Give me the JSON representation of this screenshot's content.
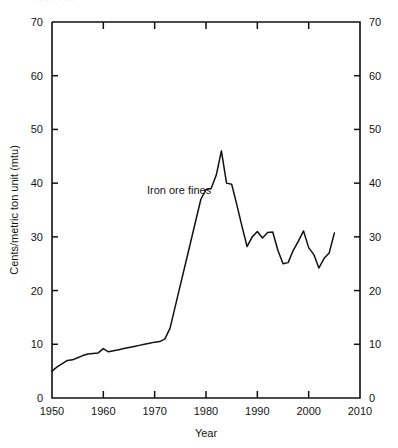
{
  "figure": {
    "top_clipped_text": "·  ·   ·    ·     ·      ·       ·",
    "background": "#ffffff",
    "line_color": "#111111"
  },
  "chart_data": {
    "type": "line",
    "title": "",
    "subtitle": "",
    "xlabel": "Year",
    "ylabel": "Cents/metric ton unit (mtu)",
    "xlim": [
      1950,
      2010
    ],
    "ylim": [
      0,
      70
    ],
    "xticks": [
      1950,
      1960,
      1970,
      1980,
      1990,
      2000,
      2010
    ],
    "xtick_labels": [
      "1950",
      "1960",
      "1970",
      "1980",
      "1990",
      "2000",
      "2010"
    ],
    "yticks": [
      0,
      10,
      20,
      30,
      40,
      50,
      60,
      70
    ],
    "ytick_labels": [
      "0",
      "10",
      "20",
      "30",
      "40",
      "50",
      "60",
      "70"
    ],
    "y_axis_right": true,
    "y_axis_right_labels": [
      "0",
      "10",
      "20",
      "30",
      "40",
      "50",
      "60",
      "70"
    ],
    "grid": false,
    "legend": "none",
    "annotations": [
      {
        "text": "Iron ore fines",
        "x": 1968.5,
        "y": 38.0
      }
    ],
    "series": [
      {
        "name": "Iron ore fines",
        "color": "#111111",
        "x": [
          1950,
          1951,
          1952,
          1953,
          1954,
          1955,
          1956,
          1957,
          1958,
          1959,
          1960,
          1961,
          1962,
          1963,
          1964,
          1965,
          1966,
          1967,
          1968,
          1969,
          1970,
          1971,
          1972,
          1973,
          1974,
          1975,
          1976,
          1977,
          1978,
          1979,
          1980,
          1981,
          1982,
          1983,
          1984,
          1985,
          1986,
          1987,
          1988,
          1989,
          1990,
          1991,
          1992,
          1993,
          1994,
          1995,
          1996,
          1997,
          1998,
          1999,
          2000,
          2001,
          2002,
          2003,
          2004,
          2005
        ],
        "values": [
          5.0,
          5.8,
          6.4,
          7.0,
          7.1,
          7.5,
          7.9,
          8.2,
          8.3,
          8.4,
          9.2,
          8.6,
          8.8,
          9.0,
          9.2,
          9.4,
          9.6,
          9.8,
          10.0,
          10.2,
          10.4,
          10.5,
          11.0,
          13.0,
          17.0,
          21.0,
          25.0,
          29.0,
          33.0,
          37.0,
          38.8,
          39.0,
          41.5,
          46.0,
          40.0,
          39.8,
          36.0,
          32.0,
          28.2,
          30.0,
          31.0,
          29.8,
          30.8,
          30.9,
          27.5,
          25.0,
          25.2,
          27.5,
          29.2,
          31.1,
          28.0,
          26.7,
          24.2,
          26.0,
          27.0,
          30.7
        ]
      }
    ]
  }
}
